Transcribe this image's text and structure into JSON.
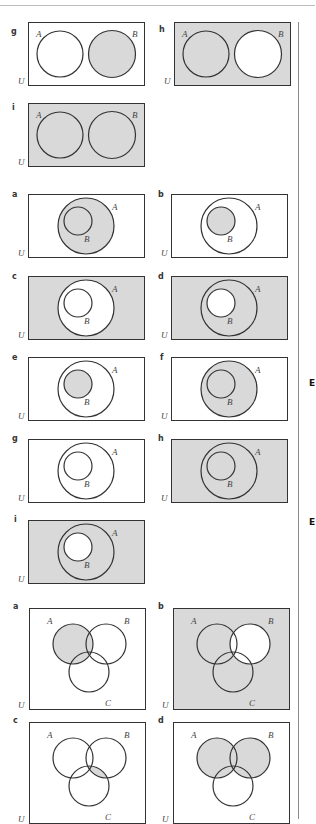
{
  "page": {
    "shade_color": "#d9d9d9",
    "line_color": "#333333",
    "margin_marks": [
      "E",
      "E"
    ]
  },
  "section_two_disjoint": {
    "description": "Two disjoint sets A and B in universal set U",
    "items": [
      {
        "label": "g",
        "set_labels": [
          "A",
          "B"
        ],
        "universe_label": "U",
        "shaded": "B"
      },
      {
        "label": "h",
        "set_labels": [
          "A",
          "B"
        ],
        "universe_label": "U",
        "shaded": "B'"
      },
      {
        "label": "i",
        "set_labels": [
          "A",
          "B"
        ],
        "universe_label": "U",
        "shaded": "U"
      }
    ]
  },
  "section_nested": {
    "description": "B is a subset of A in universal set U",
    "items": [
      {
        "label": "a",
        "set_labels": [
          "A",
          "B"
        ],
        "universe_label": "U",
        "shaded": "A"
      },
      {
        "label": "b",
        "set_labels": [
          "A",
          "B"
        ],
        "universe_label": "U",
        "shaded": "B"
      },
      {
        "label": "c",
        "set_labels": [
          "A",
          "B"
        ],
        "universe_label": "U",
        "shaded": "A'"
      },
      {
        "label": "d",
        "set_labels": [
          "A",
          "B"
        ],
        "universe_label": "U",
        "shaded": "B'"
      },
      {
        "label": "e",
        "set_labels": [
          "A",
          "B"
        ],
        "universe_label": "U",
        "shaded": "B"
      },
      {
        "label": "f",
        "set_labels": [
          "A",
          "B"
        ],
        "universe_label": "U",
        "shaded": "A"
      },
      {
        "label": "g",
        "set_labels": [
          "A",
          "B"
        ],
        "universe_label": "U",
        "shaded": "none"
      },
      {
        "label": "h",
        "set_labels": [
          "A",
          "B"
        ],
        "universe_label": "U",
        "shaded": "U"
      },
      {
        "label": "i",
        "set_labels": [
          "A",
          "B"
        ],
        "universe_label": "U",
        "shaded": "B'"
      }
    ]
  },
  "section_three_sets": {
    "description": "Three overlapping sets A, B, C in universal set U",
    "items": [
      {
        "label": "a",
        "set_labels": [
          "A",
          "B",
          "C"
        ],
        "universe_label": "U",
        "shaded": "A"
      },
      {
        "label": "b",
        "set_labels": [
          "A",
          "B",
          "C"
        ],
        "universe_label": "U",
        "shaded": "B'"
      },
      {
        "label": "c",
        "set_labels": [
          "A",
          "B",
          "C"
        ],
        "universe_label": "U",
        "shaded": "B ∩ C"
      },
      {
        "label": "d",
        "set_labels": [
          "A",
          "B",
          "C"
        ],
        "universe_label": "U",
        "shaded": "A ∪ B"
      }
    ]
  }
}
